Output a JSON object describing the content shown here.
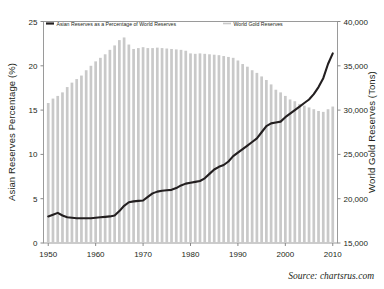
{
  "chart_data": {
    "type": "bar",
    "title": "",
    "subtitle": "",
    "xlabel": "",
    "x_tick_labels": [
      "1950",
      "1960",
      "1970",
      "1980",
      "1990",
      "2000",
      "2010"
    ],
    "x_ticks": [
      1950,
      1960,
      1970,
      1980,
      1990,
      2000,
      2010
    ],
    "xlim": [
      1949,
      2011
    ],
    "grid": false,
    "legend_position": "top-inside",
    "left_axis": {
      "label": "Asian Reserves Percentage (%)",
      "ylim": [
        0,
        25
      ],
      "tick_labels": [
        "0",
        "5",
        "10",
        "15",
        "20",
        "25"
      ],
      "ticks": [
        0,
        5,
        10,
        15,
        20,
        25
      ]
    },
    "right_axis": {
      "label": "World Gold Reserves (Tons)",
      "ylim": [
        15000,
        40000
      ],
      "tick_labels": [
        "15,000",
        "20,000",
        "25,000",
        "30,000",
        "35,000",
        "40,000"
      ],
      "ticks": [
        15000,
        20000,
        25000,
        30000,
        35000,
        40000
      ]
    },
    "categories": [
      1950,
      1951,
      1952,
      1953,
      1954,
      1955,
      1956,
      1957,
      1958,
      1959,
      1960,
      1961,
      1962,
      1963,
      1964,
      1965,
      1966,
      1967,
      1968,
      1969,
      1970,
      1971,
      1972,
      1973,
      1974,
      1975,
      1976,
      1977,
      1978,
      1979,
      1980,
      1981,
      1982,
      1983,
      1984,
      1985,
      1986,
      1987,
      1988,
      1989,
      1990,
      1991,
      1992,
      1993,
      1994,
      1995,
      1996,
      1997,
      1998,
      1999,
      2000,
      2001,
      2002,
      2003,
      2004,
      2005,
      2006,
      2007,
      2008,
      2009,
      2010
    ],
    "series": [
      {
        "name": "World Gold Reserves",
        "type": "bar",
        "axis": "right",
        "unit": "Tons",
        "color": "#c9c9c9",
        "values": [
          30800,
          31300,
          31600,
          32000,
          32600,
          33100,
          33500,
          33900,
          34500,
          35000,
          35500,
          35900,
          36300,
          36800,
          37300,
          37900,
          38200,
          37400,
          36900,
          37000,
          37100,
          37000,
          37000,
          37050,
          37000,
          36950,
          36900,
          36850,
          36800,
          36700,
          36400,
          36350,
          36400,
          36350,
          36300,
          36250,
          36200,
          36100,
          36000,
          35900,
          35600,
          35200,
          34900,
          34500,
          34200,
          33800,
          33400,
          32900,
          32300,
          32000,
          31600,
          31200,
          31000,
          30700,
          30500,
          30300,
          30100,
          29900,
          29800,
          30100,
          30400
        ]
      },
      {
        "name": "Asian Reserves as a Percentage of World Reserves",
        "type": "line",
        "axis": "left",
        "unit": "%",
        "color": "#231f20",
        "values": [
          3.0,
          3.2,
          3.4,
          3.1,
          2.9,
          2.85,
          2.8,
          2.8,
          2.8,
          2.8,
          2.85,
          2.9,
          2.95,
          3.0,
          3.1,
          3.6,
          4.2,
          4.6,
          4.7,
          4.75,
          4.8,
          5.2,
          5.6,
          5.8,
          5.9,
          5.95,
          6.0,
          6.2,
          6.5,
          6.7,
          6.8,
          6.9,
          7.0,
          7.3,
          7.8,
          8.3,
          8.6,
          8.8,
          9.2,
          9.8,
          10.2,
          10.6,
          11.0,
          11.4,
          11.8,
          12.5,
          13.2,
          13.5,
          13.6,
          13.7,
          14.2,
          14.6,
          15.0,
          15.4,
          15.8,
          16.2,
          16.8,
          17.6,
          18.6,
          20.2,
          21.4
        ]
      }
    ]
  },
  "legend": {
    "items": [
      {
        "label": "Asian Reserves as a Percentage of World Reserves",
        "marker": "line-solid-dark",
        "color": "#231f20"
      },
      {
        "label": "World Gold Reserves",
        "marker": "line-solid-gray",
        "color": "#c9c9c9"
      }
    ]
  },
  "source": {
    "text": "Source: chartsrus.com"
  },
  "colors": {
    "bar": "#c9c9c9",
    "line": "#231f20",
    "axis": "#8a8a8a",
    "text": "#231f20",
    "background": "#ffffff"
  }
}
